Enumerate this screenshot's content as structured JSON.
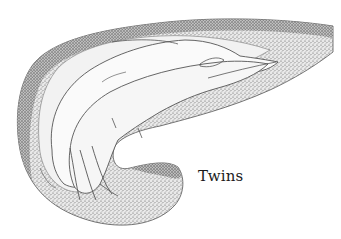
{
  "figure": {
    "caption": "Twins",
    "colors": {
      "background": "#ffffff",
      "stipple_dark": "#3a3a3a",
      "stipple_mid": "#8a8a8a",
      "outline": "#4a4a4a",
      "body_fill": "#f4f4f4"
    }
  }
}
